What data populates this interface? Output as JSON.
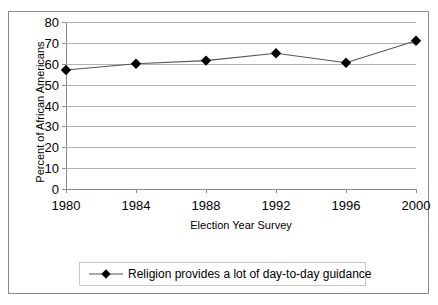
{
  "chart_data": {
    "type": "line",
    "title": "",
    "xlabel": "Election Year Survey",
    "ylabel": "Percent of African Americans",
    "categories": [
      "1980",
      "1984",
      "1988",
      "1992",
      "1996",
      "2000"
    ],
    "x": [
      1980,
      1984,
      1988,
      1992,
      1996,
      2000
    ],
    "series": [
      {
        "name": "Religion provides a lot of day-to-day guidance",
        "values": [
          57,
          60,
          61.5,
          65,
          60.5,
          71
        ],
        "marker": "diamond",
        "color": "#000000"
      }
    ],
    "ylim": [
      0,
      80
    ],
    "yticks": [
      0,
      10,
      20,
      30,
      40,
      50,
      60,
      70,
      80
    ],
    "ytick_labels": [
      "0",
      "10",
      "20",
      "30",
      "40",
      "50",
      "60",
      "70",
      "80"
    ],
    "xtick_labels": [
      "1980",
      "1984",
      "1988",
      "1992",
      "1996",
      "2000"
    ],
    "grid": "horizontal",
    "legend_position": "bottom",
    "grid_color": "#b3b3b3",
    "axis_color": "#8c8c8c",
    "border_color": "#8c8c8c"
  },
  "legend": {
    "entries": [
      {
        "label": "Religion provides a lot of day-to-day guidance",
        "marker": "diamond-marker"
      }
    ]
  }
}
